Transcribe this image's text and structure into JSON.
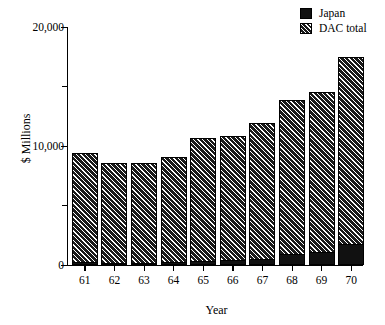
{
  "chart_data": {
    "type": "bar",
    "title": "",
    "subtitle": "",
    "xlabel": "Year",
    "ylabel": "$ Millions",
    "categories": [
      "61",
      "62",
      "63",
      "64",
      "65",
      "66",
      "67",
      "68",
      "69",
      "70"
    ],
    "ylim": [
      0,
      20000
    ],
    "y_ticks_major": [
      0,
      10000,
      20000
    ],
    "y_ticks_minor": [
      5000,
      15000
    ],
    "y_tick_labels": [
      "0",
      "10,000",
      "20,000"
    ],
    "grid": false,
    "legend_position": "top-right",
    "stacked": true,
    "series": [
      {
        "name": "DAC total",
        "fill": "hatch-diagonal",
        "values": [
          9400,
          8600,
          8600,
          9100,
          10700,
          10800,
          11900,
          13900,
          14500,
          17500
        ]
      },
      {
        "name": "Japan",
        "fill": "solid-black",
        "values": [
          250,
          200,
          200,
          280,
          300,
          450,
          500,
          900,
          1100,
          1800
        ]
      }
    ],
    "annotations": []
  },
  "legend": {
    "items": [
      {
        "label": "Japan",
        "swatch": "solid-black-swatch"
      },
      {
        "label": "DAC total",
        "swatch": "hatched-swatch"
      }
    ]
  },
  "axes": {
    "y_title": "$ Millions",
    "x_title": "Year",
    "y_labels": [
      {
        "value": 20000,
        "text": "20,000"
      },
      {
        "value": 10000,
        "text": "10,000"
      },
      {
        "value": 0,
        "text": "0"
      }
    ],
    "x_labels": [
      "61",
      "62",
      "63",
      "64",
      "65",
      "66",
      "67",
      "68",
      "69",
      "70"
    ]
  },
  "colors": {
    "ink": "#000000",
    "bar_dark": "#1a1a1a",
    "japan_solid": "#111111",
    "background": "#ffffff"
  }
}
